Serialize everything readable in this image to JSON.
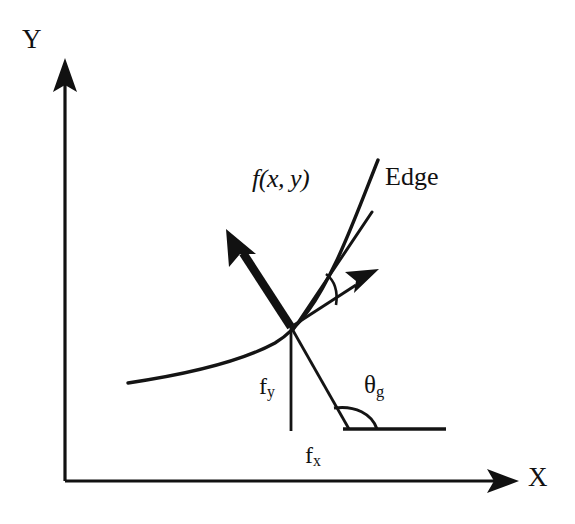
{
  "figure": {
    "background_color": "#ffffff",
    "ink_color": "#111111",
    "width": 575,
    "height": 524
  },
  "axes": {
    "y_label": "Y",
    "x_label": "X",
    "origin_px": [
      65,
      481
    ],
    "y_axis_top_px": [
      65,
      63
    ],
    "x_axis_right_px": [
      517,
      481
    ]
  },
  "labels": {
    "function": "f(x, y)",
    "function_italic_part": "f",
    "function_args": "(x, y)",
    "edge": "Edge",
    "fy": "f",
    "fy_sub": "y",
    "fx": "f",
    "fx_sub": "x",
    "theta": "θ",
    "theta_sub": "g"
  },
  "geometry": {
    "edge_point_px": [
      291,
      327
    ],
    "curve_start_px": [
      128,
      383
    ],
    "curve_end_px": [
      378,
      160
    ],
    "tangent_end_px": [
      372,
      213
    ],
    "gradient_bold_arrow_tip_px": [
      228,
      232
    ],
    "gradient_thin_arrow_tip_px": [
      377,
      271
    ],
    "fy_line_end_px": [
      291,
      430
    ],
    "normal_line_end_px": [
      348,
      428
    ],
    "baseline_start_px": [
      344,
      428
    ],
    "baseline_end_px": [
      445,
      428
    ]
  },
  "icons": {
    "y_axis_arrow": "arrow-up-icon",
    "x_axis_arrow": "arrow-right-icon",
    "gradient_vector_arrow": "arrow-bold-upleft-icon",
    "normal_vector_arrow": "arrow-thin-upright-icon"
  }
}
